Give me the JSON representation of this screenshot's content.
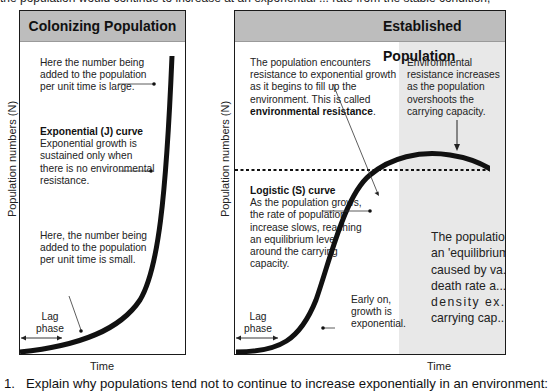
{
  "page": {
    "top_partial_line": "the population would continue to increase at an exponential ... rate from the stable condition, ...",
    "question_number": "1.",
    "question_text": "Explain why populations tend not to continue to increase exponentially in an environment:"
  },
  "left_panel": {
    "title": "Colonizing Population",
    "y_axis_label": "Population numbers (N)",
    "x_axis_label": "Time",
    "annotations": {
      "large_added": "Here the number being added to the population per unit time is large.",
      "j_curve_title": "Exponential (J) curve",
      "j_curve_text": "Exponential growth is sustained only when there is no environmental resistance.",
      "small_added": "Here, the number being added to the population per unit time is small.",
      "lag_phase": "Lag phase"
    }
  },
  "right_panel": {
    "title": "Established Population",
    "y_axis_label": "Population numbers (N)",
    "x_axis_label": "Time",
    "annotations": {
      "resistance_intro": "The population encounters resistance to exponential growth as it begins to fill up the environment. This is called",
      "resistance_term": "environmental resistance",
      "overshoot": "Environmental resistance increases as the population overshoots the carrying capacity.",
      "s_curve_title": "Logistic (S) curve",
      "s_curve_text": "As the population grows, the rate of population increase slows, reaching an equilibrium level around the carrying capacity.",
      "lag_phase": "Lag phase",
      "early_on": "Early on, growth is exponential.",
      "equilibrium_lines": [
        "The population ...",
        "an 'equilibrium' ...",
        "caused by va...",
        "death rate a...",
        "density ex...",
        "carrying cap..."
      ]
    }
  },
  "colors": {
    "header_bg": "#bdbdbd",
    "shade_bg": "#e8e8e8",
    "curve": "#111111"
  }
}
